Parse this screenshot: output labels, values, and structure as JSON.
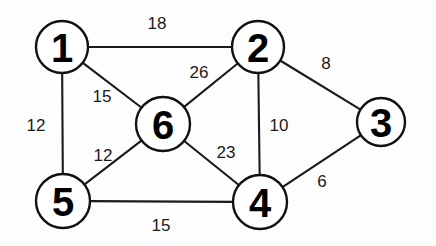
{
  "diagram": {
    "type": "weighted-undirected-graph",
    "title": "",
    "canvas": {
      "width": 436,
      "height": 246,
      "background": "#fdfdfd"
    },
    "style": {
      "node_fill": "#ffffff",
      "node_stroke": "#111111",
      "node_stroke_width": 2.4,
      "edge_stroke": "#1a1a1a",
      "edge_stroke_width": 2.1,
      "node_label_color": "#000000",
      "edge_label_color": "#1a1a1a",
      "node_label_font_size": 40,
      "edge_label_font_size": 17
    },
    "nodes": [
      {
        "id": "1",
        "label": "1",
        "cx": 62,
        "cy": 47,
        "r": 26
      },
      {
        "id": "2",
        "label": "2",
        "cx": 258,
        "cy": 47,
        "r": 26
      },
      {
        "id": "3",
        "label": "3",
        "cx": 381,
        "cy": 122,
        "r": 24
      },
      {
        "id": "4",
        "label": "4",
        "cx": 260,
        "cy": 202,
        "r": 27
      },
      {
        "id": "5",
        "label": "5",
        "cx": 63,
        "cy": 201,
        "r": 27
      },
      {
        "id": "6",
        "label": "6",
        "cx": 163,
        "cy": 124,
        "r": 27
      }
    ],
    "edges": [
      {
        "id": "e-1-2",
        "from": "1",
        "to": "2",
        "weight": "18",
        "lx": 157,
        "ly": 23
      },
      {
        "id": "e-1-6",
        "from": "1",
        "to": "6",
        "weight": "15",
        "lx": 102,
        "ly": 96
      },
      {
        "id": "e-1-5",
        "from": "1",
        "to": "5",
        "weight": "12",
        "lx": 36,
        "ly": 125
      },
      {
        "id": "e-2-6",
        "from": "2",
        "to": "6",
        "weight": "26",
        "lx": 199,
        "ly": 72
      },
      {
        "id": "e-2-3",
        "from": "2",
        "to": "3",
        "weight": "8",
        "lx": 326,
        "ly": 63
      },
      {
        "id": "e-2-4",
        "from": "2",
        "to": "4",
        "weight": "10",
        "lx": 279,
        "ly": 125
      },
      {
        "id": "e-6-5",
        "from": "6",
        "to": "5",
        "weight": "12",
        "lx": 103,
        "ly": 155
      },
      {
        "id": "e-6-4",
        "from": "6",
        "to": "4",
        "weight": "23",
        "lx": 226,
        "ly": 152
      },
      {
        "id": "e-5-4",
        "from": "5",
        "to": "4",
        "weight": "15",
        "lx": 161,
        "ly": 225
      },
      {
        "id": "e-4-3",
        "from": "4",
        "to": "3",
        "weight": "6",
        "lx": 322,
        "ly": 181
      }
    ]
  }
}
